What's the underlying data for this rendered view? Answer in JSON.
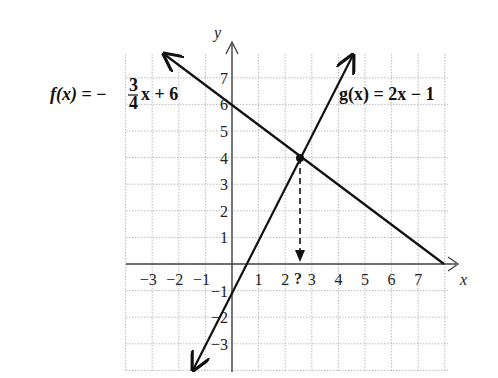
{
  "axes": {
    "x_label": "x",
    "y_label": "y",
    "x_ticks": [
      "-3",
      "-2",
      "-1",
      "1",
      "2",
      "3",
      "4",
      "5",
      "6",
      "7"
    ],
    "y_ticks": [
      "7",
      "6",
      "5",
      "4",
      "3",
      "2",
      "1",
      "-1",
      "-2",
      "-3"
    ]
  },
  "functions": {
    "f": {
      "name": "f(x)",
      "equals": "=",
      "coef_sign": "−",
      "num": "3",
      "den": "4",
      "rest": "x + 6"
    },
    "g": {
      "label": "g(x) = 2x − 1"
    }
  },
  "intersection": {
    "marker": "?",
    "x": 2.73,
    "y": 4.18
  },
  "chart_data": {
    "type": "line",
    "title": "",
    "xlabel": "x",
    "ylabel": "y",
    "xlim": [
      -4,
      8
    ],
    "ylim": [
      -4,
      8
    ],
    "grid": true,
    "series": [
      {
        "name": "f(x) = -3/4 x + 6",
        "slope": -0.75,
        "intercept": 6,
        "x": [
          -2,
          8
        ],
        "y": [
          7.5,
          0
        ]
      },
      {
        "name": "g(x) = 2x - 1",
        "slope": 2,
        "intercept": -1,
        "x": [
          -1.5,
          4.2
        ],
        "y": [
          -4,
          7.4
        ]
      }
    ],
    "annotations": [
      {
        "text": "?",
        "x": 2.55,
        "y": 0,
        "note": "dashed arrow from intersection to x-axis"
      }
    ]
  }
}
